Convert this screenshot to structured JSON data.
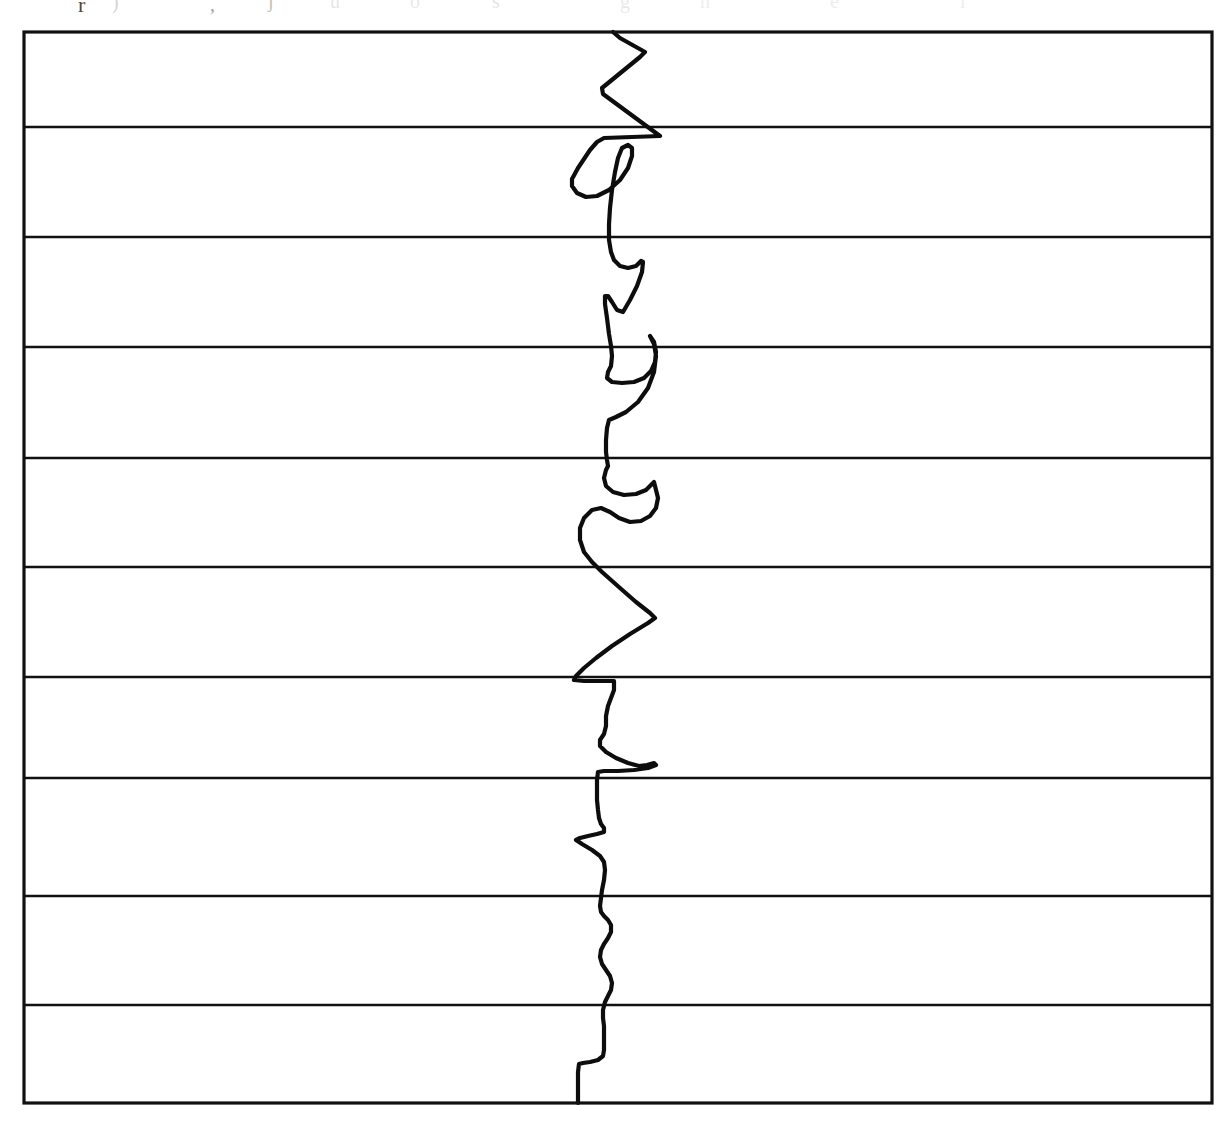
{
  "page": {
    "background_color": "#ffffff",
    "width": 1229,
    "height": 1122
  },
  "scan_artifacts": {
    "description": "faint clipped descenders of a text line above the figure",
    "glyphs": [
      {
        "text": "r",
        "x": 78,
        "y": -6,
        "size": 22,
        "opacity": 0.85
      },
      {
        "text": ")",
        "x": 112,
        "y": -8,
        "size": 20,
        "opacity": 0.2
      },
      {
        "text": ",",
        "x": 210,
        "y": -6,
        "size": 20,
        "opacity": 0.45
      },
      {
        "text": "j",
        "x": 268,
        "y": -10,
        "size": 20,
        "opacity": 0.3
      },
      {
        "text": "u",
        "x": 330,
        "y": -9,
        "size": 20,
        "opacity": 0.12
      },
      {
        "text": "o",
        "x": 410,
        "y": -9,
        "size": 20,
        "opacity": 0.1
      },
      {
        "text": "s",
        "x": 492,
        "y": -9,
        "size": 20,
        "opacity": 0.12
      },
      {
        "text": "g",
        "x": 620,
        "y": -9,
        "size": 20,
        "opacity": 0.1
      },
      {
        "text": "n",
        "x": 700,
        "y": -9,
        "size": 20,
        "opacity": 0.08
      },
      {
        "text": "e",
        "x": 830,
        "y": -9,
        "size": 20,
        "opacity": 0.08
      },
      {
        "text": "i",
        "x": 960,
        "y": -9,
        "size": 20,
        "opacity": 0.08
      }
    ]
  },
  "frame": {
    "stroke_color": "#111111",
    "left": 24,
    "top": 32,
    "right": 1212,
    "bottom": 1103,
    "border_width": 3.2
  },
  "chart_data": {
    "type": "line",
    "title": "",
    "subtitle": "",
    "xlabel": "",
    "ylabel": "",
    "orientation": "vertical",
    "grid": true,
    "grid_axis": "horizontal",
    "legend": false,
    "legend_position": "none",
    "xlim": [
      24,
      1212
    ],
    "ylim": [
      32,
      1103
    ],
    "x_tick_labels": [],
    "y_tick_labels": [],
    "gridlines_y": [
      127,
      237,
      347,
      458,
      567,
      677,
      778,
      896,
      1005
    ],
    "series": [
      {
        "name": "trace-1",
        "color": "#0d0d0d",
        "line_width": 4.2,
        "baseline_x": 610,
        "points": [
          [
            613,
            32
          ],
          [
            620,
            38
          ],
          [
            645,
            52
          ],
          [
            640,
            57
          ],
          [
            602,
            88
          ],
          [
            603,
            94
          ],
          [
            660,
            136
          ],
          [
            604,
            138
          ],
          [
            597,
            142
          ],
          [
            590,
            150
          ],
          [
            578,
            168
          ],
          [
            572,
            179
          ],
          [
            572,
            186
          ],
          [
            577,
            193
          ],
          [
            586,
            197
          ],
          [
            597,
            196
          ],
          [
            609,
            190
          ],
          [
            620,
            180
          ],
          [
            628,
            168
          ],
          [
            632,
            156
          ],
          [
            632,
            148
          ],
          [
            628,
            145
          ],
          [
            622,
            148
          ],
          [
            618,
            158
          ],
          [
            615,
            172
          ],
          [
            612,
            190
          ],
          [
            610,
            208
          ],
          [
            609,
            224
          ],
          [
            609,
            240
          ],
          [
            611,
            252
          ],
          [
            614,
            260
          ],
          [
            620,
            266
          ],
          [
            628,
            268
          ],
          [
            636,
            266
          ],
          [
            641,
            261
          ],
          [
            643,
            262
          ],
          [
            642,
            272
          ],
          [
            637,
            286
          ],
          [
            630,
            300
          ],
          [
            623,
            312
          ],
          [
            617,
            310
          ],
          [
            612,
            302
          ],
          [
            608,
            296
          ],
          [
            605,
            296
          ],
          [
            605,
            304
          ],
          [
            607,
            318
          ],
          [
            609,
            334
          ],
          [
            611,
            346
          ],
          [
            612,
            356
          ],
          [
            611,
            366
          ],
          [
            608,
            372
          ],
          [
            607,
            378
          ],
          [
            612,
            382
          ],
          [
            622,
            383
          ],
          [
            634,
            382
          ],
          [
            644,
            378
          ],
          [
            651,
            371
          ],
          [
            655,
            362
          ],
          [
            656,
            352
          ],
          [
            654,
            342
          ],
          [
            650,
            336
          ],
          [
            650,
            336
          ],
          [
            654,
            344
          ],
          [
            656,
            356
          ],
          [
            654,
            372
          ],
          [
            648,
            388
          ],
          [
            638,
            402
          ],
          [
            626,
            412
          ],
          [
            616,
            417
          ],
          [
            609,
            420
          ],
          [
            607,
            428
          ],
          [
            606,
            440
          ],
          [
            606,
            452
          ],
          [
            607,
            460
          ],
          [
            608,
            466
          ],
          [
            606,
            470
          ],
          [
            604,
            478
          ],
          [
            606,
            486
          ],
          [
            613,
            492
          ],
          [
            624,
            495
          ],
          [
            636,
            494
          ],
          [
            646,
            490
          ],
          [
            654,
            482
          ],
          [
            658,
            498
          ],
          [
            656,
            508
          ],
          [
            650,
            516
          ],
          [
            641,
            521
          ],
          [
            630,
            522
          ],
          [
            619,
            518
          ],
          [
            610,
            512
          ],
          [
            601,
            508
          ],
          [
            592,
            510
          ],
          [
            584,
            518
          ],
          [
            580,
            528
          ],
          [
            580,
            540
          ],
          [
            584,
            552
          ],
          [
            592,
            562
          ],
          [
            602,
            572
          ],
          [
            620,
            588
          ],
          [
            636,
            602
          ],
          [
            650,
            613
          ],
          [
            655,
            618
          ],
          [
            648,
            623
          ],
          [
            630,
            634
          ],
          [
            612,
            646
          ],
          [
            596,
            658
          ],
          [
            584,
            668
          ],
          [
            576,
            676
          ],
          [
            574,
            680
          ],
          [
            584,
            681
          ],
          [
            600,
            681
          ],
          [
            614,
            681
          ],
          [
            614,
            690
          ],
          [
            611,
            698
          ],
          [
            608,
            706
          ],
          [
            606,
            716
          ],
          [
            606,
            726
          ],
          [
            604,
            734
          ],
          [
            600,
            740
          ],
          [
            600,
            746
          ],
          [
            606,
            752
          ],
          [
            616,
            758
          ],
          [
            628,
            763
          ],
          [
            639,
            766
          ],
          [
            647,
            765
          ],
          [
            654,
            763
          ],
          [
            656,
            765
          ],
          [
            648,
            768
          ],
          [
            634,
            770
          ],
          [
            618,
            771
          ],
          [
            604,
            771
          ],
          [
            598,
            772
          ],
          [
            597,
            780
          ],
          [
            597,
            790
          ],
          [
            597,
            800
          ],
          [
            598,
            810
          ],
          [
            599,
            818
          ],
          [
            601,
            824
          ],
          [
            604,
            828
          ],
          [
            604,
            832
          ],
          [
            597,
            834
          ],
          [
            588,
            836
          ],
          [
            580,
            838
          ],
          [
            576,
            840
          ],
          [
            582,
            844
          ],
          [
            592,
            850
          ],
          [
            600,
            856
          ],
          [
            604,
            862
          ],
          [
            605,
            870
          ],
          [
            604,
            880
          ],
          [
            602,
            890
          ],
          [
            601,
            898
          ],
          [
            600,
            906
          ],
          [
            601,
            912
          ],
          [
            604,
            916
          ],
          [
            608,
            920
          ],
          [
            611,
            925
          ],
          [
            611,
            932
          ],
          [
            608,
            938
          ],
          [
            604,
            944
          ],
          [
            601,
            950
          ],
          [
            600,
            957
          ],
          [
            602,
            964
          ],
          [
            606,
            970
          ],
          [
            610,
            976
          ],
          [
            612,
            983
          ],
          [
            611,
            990
          ],
          [
            608,
            996
          ],
          [
            605,
            1002
          ],
          [
            603,
            1010
          ],
          [
            603,
            1018
          ],
          [
            604,
            1026
          ],
          [
            604,
            1034
          ],
          [
            604,
            1042
          ],
          [
            604,
            1050
          ],
          [
            603,
            1056
          ],
          [
            598,
            1060
          ],
          [
            590,
            1062
          ],
          [
            583,
            1063
          ],
          [
            579,
            1064
          ],
          [
            578,
            1072
          ],
          [
            578,
            1082
          ],
          [
            578,
            1092
          ],
          [
            578,
            1103
          ]
        ]
      }
    ]
  }
}
